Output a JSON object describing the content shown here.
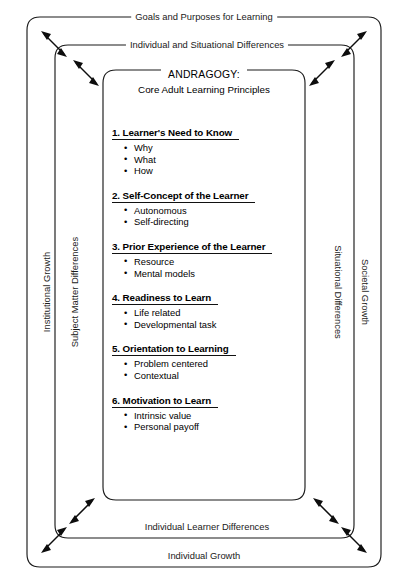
{
  "diagram": {
    "layers": {
      "outer": {
        "top_label": "Goals and Purposes for Learning",
        "left_label": "Institutional Growth",
        "right_label": "Societal Growth",
        "bottom_label": "Individual Growth"
      },
      "middle": {
        "top_label": "Individual and Situational Differences",
        "left_label": "Subject Matter Differences",
        "right_label": "Situational Differences",
        "bottom_label": "Individual Learner Differences"
      },
      "inner": {
        "title_line1": "ANDRAGOGY:",
        "title_line2": "Core Adult Learning Principles"
      }
    },
    "principles": [
      {
        "heading": "1. Learner's Need to Know",
        "items": [
          "Why",
          "What",
          "How"
        ]
      },
      {
        "heading": "2. Self-Concept of the Learner",
        "items": [
          "Autonomous",
          "Self-directing"
        ]
      },
      {
        "heading": "3. Prior Experience of the Learner",
        "items": [
          "Resource",
          "Mental models"
        ]
      },
      {
        "heading": "4. Readiness to Learn",
        "items": [
          "Life related",
          "Developmental task"
        ]
      },
      {
        "heading": "5. Orientation to Learning",
        "items": [
          "Problem centered",
          "Contextual"
        ]
      },
      {
        "heading": "6. Motivation to Learn",
        "items": [
          "Intrinsic value",
          "Personal payoff"
        ]
      }
    ],
    "colors": {
      "stroke": "#1b1b1b",
      "text": "#1a1a1a",
      "background": "#ffffff"
    }
  }
}
